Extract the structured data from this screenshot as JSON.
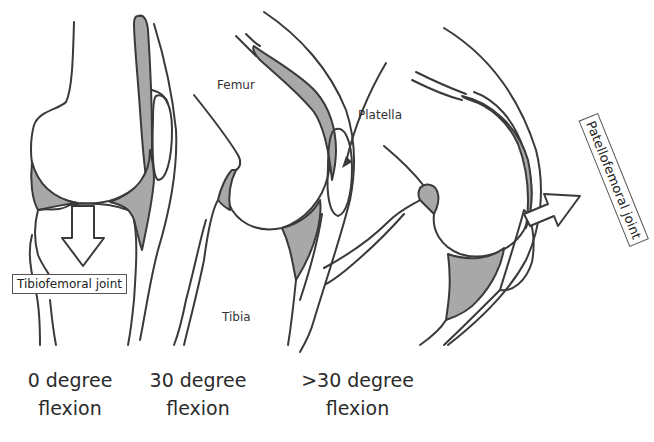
{
  "figure": {
    "panels": [
      {
        "id": "panel-0",
        "caption_line1": "0 degree",
        "caption_line2": "flexion",
        "callout": "Tibiofemoral joint",
        "callout_arrow": "down-arrow"
      },
      {
        "id": "panel-30",
        "caption_line1": "30 degree",
        "caption_line2": "flexion",
        "labels": {
          "femur": "Femur",
          "tibia": "Tibia",
          "patella": "Platella"
        }
      },
      {
        "id": "panel-gt30",
        "caption_line1": ">30 degree",
        "caption_line2": "flexion",
        "callout": "Patellofemoral joint",
        "callout_arrow": "right-arrow"
      }
    ],
    "colors": {
      "outline": "#3a3a3a",
      "cartilage_fill": "#a8a8a8",
      "background": "#ffffff"
    }
  }
}
